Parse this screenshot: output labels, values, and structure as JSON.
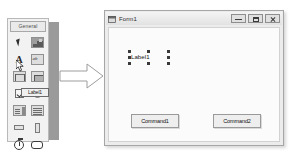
{
  "toolbox": {
    "tab_label": "General",
    "tools": [
      {
        "name": "pointer-tool",
        "label": "Pointer"
      },
      {
        "name": "picturebox-tool",
        "label": "PictureBox"
      },
      {
        "name": "label-tool",
        "label": "Label"
      },
      {
        "name": "textbox-tool",
        "label": "TextBox",
        "glyph": "ab"
      },
      {
        "name": "frame-tool",
        "label": "Frame"
      },
      {
        "name": "commandbutton-tool",
        "label": "CommandButton"
      },
      {
        "name": "checkbox-tool",
        "label": "CheckBox"
      },
      {
        "name": "optionbutton-tool",
        "label": "OptionButton"
      },
      {
        "name": "combobox-tool",
        "label": "ComboBox"
      },
      {
        "name": "listbox-tool",
        "label": "ListBox"
      },
      {
        "name": "hscrollbar-tool",
        "label": "HScrollBar"
      },
      {
        "name": "vscrollbar-tool",
        "label": "VScrollBar"
      },
      {
        "name": "timer-tool",
        "label": "Timer"
      },
      {
        "name": "shape-tool",
        "label": "Shape"
      }
    ],
    "drag_ghost_label": "Label1"
  },
  "arrow": {
    "name": "flow-arrow",
    "direction": "right"
  },
  "form": {
    "title": "Form1",
    "window_buttons": [
      {
        "name": "minimize-button",
        "label": "Minimize"
      },
      {
        "name": "maximize-button",
        "label": "Maximize"
      },
      {
        "name": "close-button",
        "label": "Close"
      }
    ],
    "label_control": "Label1",
    "buttons": [
      {
        "name": "command1-button",
        "label": "Command1"
      },
      {
        "name": "command2-button",
        "label": "Command2"
      }
    ]
  },
  "colors": {
    "toolbox_bg": "#f2f2f2",
    "divider_gray": "#9a9a9a",
    "form_chrome": "#ececec",
    "form_canvas": "#fbfbfb",
    "grid_dot": "#c8c8c8",
    "selection_handle": "#3a3a3a"
  }
}
